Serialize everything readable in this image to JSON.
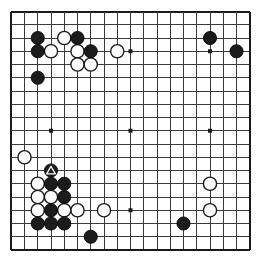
{
  "app": {
    "title": "Go board diagram",
    "kind": "go-board-19x19"
  },
  "board": {
    "size": 19,
    "origin_x": 11.25,
    "origin_y": 11.5,
    "spacing": 13.25,
    "stone_radius": 6.6,
    "line_color": "#3a3a3a",
    "edge_color": "#1b1b1b",
    "background_color": "#ffffff",
    "black_color": "#1b1b1b",
    "white_color": "#fdfdfd",
    "line_width": 1,
    "edge_width": 2,
    "star_radius": 2.0,
    "star_points": [
      {
        "col": 3,
        "row": 3
      },
      {
        "col": 9,
        "row": 3
      },
      {
        "col": 15,
        "row": 3
      },
      {
        "col": 3,
        "row": 9
      },
      {
        "col": 9,
        "row": 9
      },
      {
        "col": 15,
        "row": 9
      },
      {
        "col": 3,
        "row": 15
      },
      {
        "col": 9,
        "row": 15
      },
      {
        "col": 15,
        "row": 15
      }
    ]
  },
  "stones": {
    "black": [
      {
        "col": 2,
        "row": 2
      },
      {
        "col": 5,
        "row": 2
      },
      {
        "col": 15,
        "row": 2
      },
      {
        "col": 2,
        "row": 3
      },
      {
        "col": 6,
        "row": 3
      },
      {
        "col": 17,
        "row": 3
      },
      {
        "col": 2,
        "row": 5
      },
      {
        "col": 3,
        "row": 12
      },
      {
        "col": 3,
        "row": 13
      },
      {
        "col": 4,
        "row": 13
      },
      {
        "col": 4,
        "row": 14
      },
      {
        "col": 3,
        "row": 15
      },
      {
        "col": 2,
        "row": 16
      },
      {
        "col": 3,
        "row": 16
      },
      {
        "col": 4,
        "row": 16
      },
      {
        "col": 6,
        "row": 17
      },
      {
        "col": 13,
        "row": 16
      }
    ],
    "white": [
      {
        "col": 4,
        "row": 2
      },
      {
        "col": 3,
        "row": 3
      },
      {
        "col": 5,
        "row": 3
      },
      {
        "col": 8,
        "row": 3
      },
      {
        "col": 5,
        "row": 4
      },
      {
        "col": 6,
        "row": 4
      },
      {
        "col": 1,
        "row": 11
      },
      {
        "col": 2,
        "row": 13
      },
      {
        "col": 2,
        "row": 14
      },
      {
        "col": 3,
        "row": 14
      },
      {
        "col": 2,
        "row": 15
      },
      {
        "col": 4,
        "row": 15
      },
      {
        "col": 5,
        "row": 15
      },
      {
        "col": 7,
        "row": 15
      },
      {
        "col": 15,
        "row": 13
      },
      {
        "col": 15,
        "row": 15
      }
    ]
  },
  "marks": [
    {
      "type": "triangle",
      "col": 3,
      "row": 12,
      "on": "black",
      "color": "#ffffff"
    }
  ],
  "legend": {
    "triangle_meaning": "marked stone"
  }
}
